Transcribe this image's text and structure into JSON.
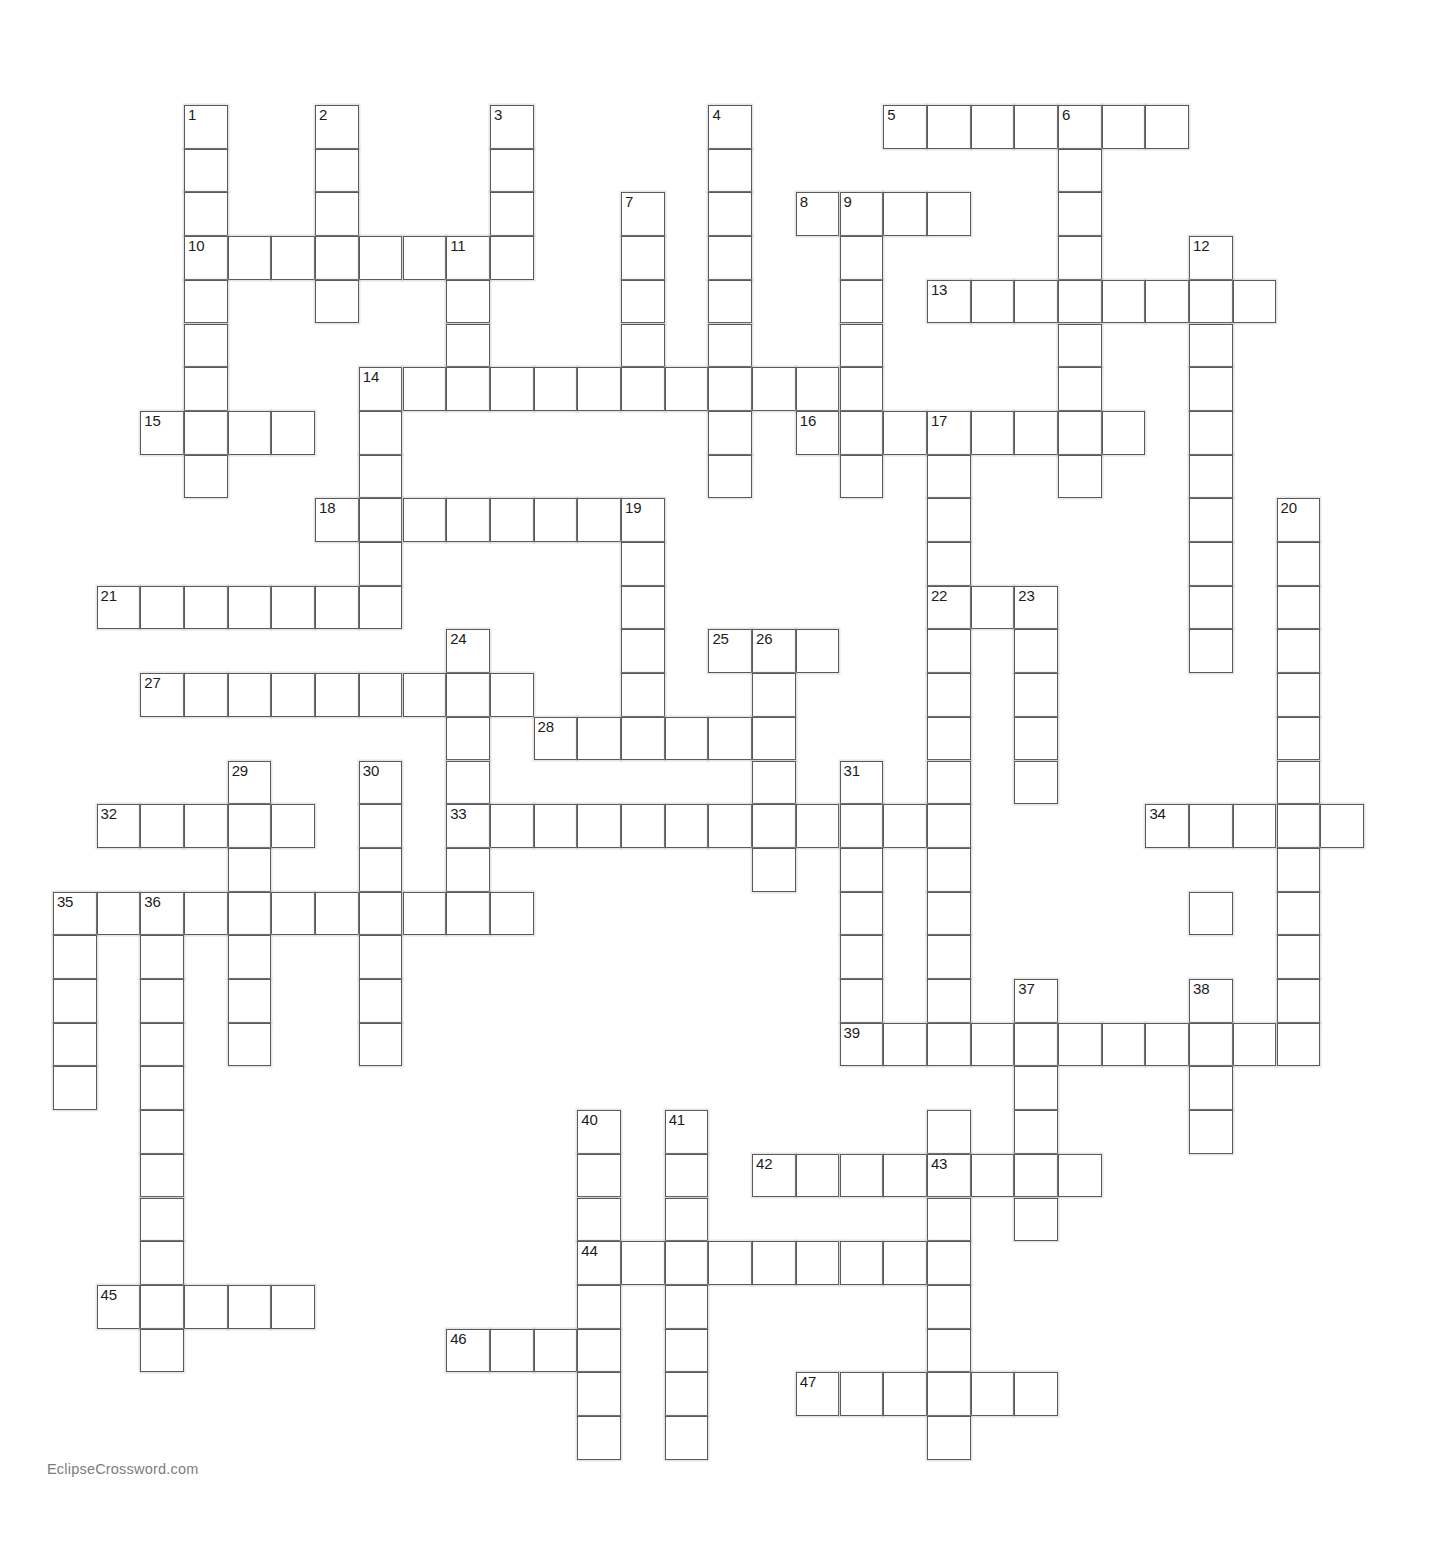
{
  "page": {
    "watermark": "EclipseCrossword.com",
    "background_color": "#ffffff",
    "cell_border_color": "#5a5a5a",
    "cell_fill_color": "#ffffff",
    "number_color": "#1c1c1c",
    "watermark_color": "#7d7d81"
  },
  "grid": {
    "cell_size": 43.7,
    "origin_x": 184,
    "origin_y": 105,
    "columns": 29,
    "rows": 32,
    "cells": [
      {
        "c": 0,
        "r": 0,
        "n": "1"
      },
      {
        "c": 0,
        "r": 1
      },
      {
        "c": 0,
        "r": 2
      },
      {
        "c": 3,
        "r": 0,
        "n": "2"
      },
      {
        "c": 3,
        "r": 1
      },
      {
        "c": 3,
        "r": 2
      },
      {
        "c": 7,
        "r": 0,
        "n": "3"
      },
      {
        "c": 7,
        "r": 1
      },
      {
        "c": 7,
        "r": 2
      },
      {
        "c": 12,
        "r": 0,
        "n": "4"
      },
      {
        "c": 12,
        "r": 1
      },
      {
        "c": 12,
        "r": 2
      },
      {
        "c": 16,
        "r": 0,
        "n": "5"
      },
      {
        "c": 17,
        "r": 0
      },
      {
        "c": 18,
        "r": 0
      },
      {
        "c": 19,
        "r": 0
      },
      {
        "c": 20,
        "r": 0,
        "n": "6"
      },
      {
        "c": 21,
        "r": 0
      },
      {
        "c": 22,
        "r": 0
      },
      {
        "c": 10,
        "r": 2,
        "n": "7"
      },
      {
        "c": 14,
        "r": 2,
        "n": "8"
      },
      {
        "c": 15,
        "r": 2,
        "n": "9"
      },
      {
        "c": 16,
        "r": 2
      },
      {
        "c": 17,
        "r": 2
      },
      {
        "c": 20,
        "r": 1
      },
      {
        "c": 20,
        "r": 2
      },
      {
        "c": 0,
        "r": 3,
        "n": "10"
      },
      {
        "c": 1,
        "r": 3
      },
      {
        "c": 2,
        "r": 3
      },
      {
        "c": 3,
        "r": 3
      },
      {
        "c": 4,
        "r": 3
      },
      {
        "c": 5,
        "r": 3
      },
      {
        "c": 6,
        "r": 3,
        "n": "11"
      },
      {
        "c": 7,
        "r": 3
      },
      {
        "c": 10,
        "r": 3
      },
      {
        "c": 12,
        "r": 3
      },
      {
        "c": 15,
        "r": 3
      },
      {
        "c": 20,
        "r": 3
      },
      {
        "c": 23,
        "r": 3,
        "n": "12"
      },
      {
        "c": 0,
        "r": 4
      },
      {
        "c": 3,
        "r": 4
      },
      {
        "c": 6,
        "r": 4
      },
      {
        "c": 10,
        "r": 4
      },
      {
        "c": 12,
        "r": 4
      },
      {
        "c": 15,
        "r": 4
      },
      {
        "c": 17,
        "r": 4,
        "n": "13"
      },
      {
        "c": 18,
        "r": 4
      },
      {
        "c": 19,
        "r": 4
      },
      {
        "c": 20,
        "r": 4
      },
      {
        "c": 21,
        "r": 4
      },
      {
        "c": 22,
        "r": 4
      },
      {
        "c": 23,
        "r": 4
      },
      {
        "c": 24,
        "r": 4
      },
      {
        "c": 0,
        "r": 5
      },
      {
        "c": 6,
        "r": 5
      },
      {
        "c": 10,
        "r": 5
      },
      {
        "c": 12,
        "r": 5
      },
      {
        "c": 15,
        "r": 5
      },
      {
        "c": 20,
        "r": 5
      },
      {
        "c": 23,
        "r": 5
      },
      {
        "c": 0,
        "r": 6
      },
      {
        "c": 4,
        "r": 6,
        "n": "14"
      },
      {
        "c": 5,
        "r": 6
      },
      {
        "c": 6,
        "r": 6
      },
      {
        "c": 7,
        "r": 6
      },
      {
        "c": 8,
        "r": 6
      },
      {
        "c": 9,
        "r": 6
      },
      {
        "c": 10,
        "r": 6
      },
      {
        "c": 11,
        "r": 6
      },
      {
        "c": 12,
        "r": 6
      },
      {
        "c": 13,
        "r": 6
      },
      {
        "c": 14,
        "r": 6
      },
      {
        "c": 15,
        "r": 6
      },
      {
        "c": 20,
        "r": 6
      },
      {
        "c": 23,
        "r": 6
      },
      {
        "c": -1,
        "r": 7,
        "n": "15"
      },
      {
        "c": 0,
        "r": 7
      },
      {
        "c": 1,
        "r": 7
      },
      {
        "c": 2,
        "r": 7
      },
      {
        "c": 4,
        "r": 7
      },
      {
        "c": 12,
        "r": 7
      },
      {
        "c": 14,
        "r": 7,
        "n": "16"
      },
      {
        "c": 15,
        "r": 7
      },
      {
        "c": 16,
        "r": 7
      },
      {
        "c": 17,
        "r": 7,
        "n": "17"
      },
      {
        "c": 18,
        "r": 7
      },
      {
        "c": 19,
        "r": 7
      },
      {
        "c": 20,
        "r": 7
      },
      {
        "c": 21,
        "r": 7
      },
      {
        "c": 23,
        "r": 7
      },
      {
        "c": 0,
        "r": 8
      },
      {
        "c": 4,
        "r": 8
      },
      {
        "c": 12,
        "r": 8
      },
      {
        "c": 15,
        "r": 8
      },
      {
        "c": 17,
        "r": 8
      },
      {
        "c": 20,
        "r": 8
      },
      {
        "c": 23,
        "r": 8
      },
      {
        "c": 3,
        "r": 9,
        "n": "18"
      },
      {
        "c": 4,
        "r": 9
      },
      {
        "c": 5,
        "r": 9
      },
      {
        "c": 6,
        "r": 9
      },
      {
        "c": 7,
        "r": 9
      },
      {
        "c": 8,
        "r": 9
      },
      {
        "c": 9,
        "r": 9
      },
      {
        "c": 10,
        "r": 9,
        "n": "19"
      },
      {
        "c": 17,
        "r": 9
      },
      {
        "c": 23,
        "r": 9
      },
      {
        "c": 25,
        "r": 9,
        "n": "20"
      },
      {
        "c": 4,
        "r": 10
      },
      {
        "c": 10,
        "r": 10
      },
      {
        "c": 17,
        "r": 10
      },
      {
        "c": 23,
        "r": 10
      },
      {
        "c": 25,
        "r": 10
      },
      {
        "c": -2,
        "r": 11,
        "n": "21"
      },
      {
        "c": -1,
        "r": 11
      },
      {
        "c": 0,
        "r": 11
      },
      {
        "c": 1,
        "r": 11
      },
      {
        "c": 2,
        "r": 11
      },
      {
        "c": 3,
        "r": 11
      },
      {
        "c": 4,
        "r": 11
      },
      {
        "c": 10,
        "r": 11
      },
      {
        "c": 17,
        "r": 11,
        "n": "22"
      },
      {
        "c": 18,
        "r": 11
      },
      {
        "c": 19,
        "r": 11,
        "n": "23"
      },
      {
        "c": 23,
        "r": 11
      },
      {
        "c": 25,
        "r": 11
      },
      {
        "c": 6,
        "r": 12,
        "n": "24"
      },
      {
        "c": 10,
        "r": 12
      },
      {
        "c": 12,
        "r": 12,
        "n": "25"
      },
      {
        "c": 13,
        "r": 12,
        "n": "26"
      },
      {
        "c": 14,
        "r": 12
      },
      {
        "c": 17,
        "r": 12
      },
      {
        "c": 19,
        "r": 12
      },
      {
        "c": 23,
        "r": 12
      },
      {
        "c": 25,
        "r": 12
      },
      {
        "c": -1,
        "r": 13,
        "n": "27"
      },
      {
        "c": 0,
        "r": 13
      },
      {
        "c": 1,
        "r": 13
      },
      {
        "c": 2,
        "r": 13
      },
      {
        "c": 3,
        "r": 13
      },
      {
        "c": 4,
        "r": 13
      },
      {
        "c": 5,
        "r": 13
      },
      {
        "c": 6,
        "r": 13
      },
      {
        "c": 7,
        "r": 13
      },
      {
        "c": 10,
        "r": 13
      },
      {
        "c": 13,
        "r": 13
      },
      {
        "c": 17,
        "r": 13
      },
      {
        "c": 19,
        "r": 13
      },
      {
        "c": 25,
        "r": 13
      },
      {
        "c": 6,
        "r": 14
      },
      {
        "c": 8,
        "r": 14,
        "n": "28"
      },
      {
        "c": 9,
        "r": 14
      },
      {
        "c": 10,
        "r": 14
      },
      {
        "c": 11,
        "r": 14
      },
      {
        "c": 12,
        "r": 14
      },
      {
        "c": 13,
        "r": 14
      },
      {
        "c": 17,
        "r": 14
      },
      {
        "c": 19,
        "r": 14
      },
      {
        "c": 25,
        "r": 14
      },
      {
        "c": 6,
        "r": 15
      },
      {
        "c": 13,
        "r": 15
      },
      {
        "c": 15,
        "r": 15,
        "n": "31"
      },
      {
        "c": 17,
        "r": 15
      },
      {
        "c": 19,
        "r": 15
      },
      {
        "c": 25,
        "r": 15
      },
      {
        "c": 1,
        "r": 15,
        "n": "29"
      },
      {
        "c": 4,
        "r": 15,
        "n": "30"
      },
      {
        "c": -2,
        "r": 16,
        "n": "32"
      },
      {
        "c": -1,
        "r": 16
      },
      {
        "c": 0,
        "r": 16
      },
      {
        "c": 1,
        "r": 16
      },
      {
        "c": 2,
        "r": 16
      },
      {
        "c": 4,
        "r": 16
      },
      {
        "c": 6,
        "r": 16,
        "n": "33"
      },
      {
        "c": 7,
        "r": 16
      },
      {
        "c": 8,
        "r": 16
      },
      {
        "c": 9,
        "r": 16
      },
      {
        "c": 10,
        "r": 16
      },
      {
        "c": 11,
        "r": 16
      },
      {
        "c": 12,
        "r": 16
      },
      {
        "c": 13,
        "r": 16
      },
      {
        "c": 14,
        "r": 16
      },
      {
        "c": 15,
        "r": 16
      },
      {
        "c": 16,
        "r": 16
      },
      {
        "c": 17,
        "r": 16
      },
      {
        "c": 22,
        "r": 16,
        "n": "34"
      },
      {
        "c": 23,
        "r": 16
      },
      {
        "c": 24,
        "r": 16
      },
      {
        "c": 25,
        "r": 16
      },
      {
        "c": 26,
        "r": 16
      },
      {
        "c": 1,
        "r": 17
      },
      {
        "c": 4,
        "r": 17
      },
      {
        "c": 6,
        "r": 17
      },
      {
        "c": 13,
        "r": 17
      },
      {
        "c": 15,
        "r": 17
      },
      {
        "c": 17,
        "r": 17
      },
      {
        "c": 25,
        "r": 17
      },
      {
        "c": -3,
        "r": 18,
        "n": "35"
      },
      {
        "c": -2,
        "r": 18
      },
      {
        "c": -1,
        "r": 18,
        "n": "36"
      },
      {
        "c": 0,
        "r": 18
      },
      {
        "c": 1,
        "r": 18
      },
      {
        "c": 2,
        "r": 18
      },
      {
        "c": 3,
        "r": 18
      },
      {
        "c": 4,
        "r": 18
      },
      {
        "c": 5,
        "r": 18
      },
      {
        "c": 6,
        "r": 18
      },
      {
        "c": 7,
        "r": 18
      },
      {
        "c": 15,
        "r": 18
      },
      {
        "c": 17,
        "r": 18
      },
      {
        "c": 23,
        "r": 18
      },
      {
        "c": 25,
        "r": 18
      },
      {
        "c": -3,
        "r": 19
      },
      {
        "c": -1,
        "r": 19
      },
      {
        "c": 1,
        "r": 19
      },
      {
        "c": 4,
        "r": 19
      },
      {
        "c": 15,
        "r": 19
      },
      {
        "c": 17,
        "r": 19
      },
      {
        "c": 25,
        "r": 19
      },
      {
        "c": -3,
        "r": 20
      },
      {
        "c": -1,
        "r": 20
      },
      {
        "c": 1,
        "r": 20
      },
      {
        "c": 4,
        "r": 20
      },
      {
        "c": 15,
        "r": 20
      },
      {
        "c": 19,
        "r": 20,
        "n": "37"
      },
      {
        "c": 17,
        "r": 20
      },
      {
        "c": 23,
        "r": 20,
        "n": "38"
      },
      {
        "c": 25,
        "r": 20
      },
      {
        "c": -3,
        "r": 21
      },
      {
        "c": -1,
        "r": 21
      },
      {
        "c": 1,
        "r": 21
      },
      {
        "c": 4,
        "r": 21
      },
      {
        "c": 15,
        "r": 21,
        "n": "39"
      },
      {
        "c": 16,
        "r": 21
      },
      {
        "c": 17,
        "r": 21
      },
      {
        "c": 18,
        "r": 21
      },
      {
        "c": 19,
        "r": 21
      },
      {
        "c": 20,
        "r": 21
      },
      {
        "c": 21,
        "r": 21
      },
      {
        "c": 22,
        "r": 21
      },
      {
        "c": 23,
        "r": 21
      },
      {
        "c": 24,
        "r": 21
      },
      {
        "c": 25,
        "r": 21
      },
      {
        "c": -3,
        "r": 22
      },
      {
        "c": -1,
        "r": 22
      },
      {
        "c": 19,
        "r": 22
      },
      {
        "c": 23,
        "r": 22
      },
      {
        "c": -1,
        "r": 23
      },
      {
        "c": 9,
        "r": 23,
        "n": "40"
      },
      {
        "c": 11,
        "r": 23,
        "n": "41"
      },
      {
        "c": 17,
        "r": 23
      },
      {
        "c": 19,
        "r": 23
      },
      {
        "c": 23,
        "r": 23
      },
      {
        "c": -1,
        "r": 24
      },
      {
        "c": 9,
        "r": 24
      },
      {
        "c": 11,
        "r": 24
      },
      {
        "c": 13,
        "r": 24,
        "n": "42"
      },
      {
        "c": 14,
        "r": 24
      },
      {
        "c": 15,
        "r": 24
      },
      {
        "c": 16,
        "r": 24
      },
      {
        "c": 17,
        "r": 24,
        "n": "43"
      },
      {
        "c": 18,
        "r": 24
      },
      {
        "c": 19,
        "r": 24
      },
      {
        "c": 20,
        "r": 24
      },
      {
        "c": -1,
        "r": 25
      },
      {
        "c": 9,
        "r": 25
      },
      {
        "c": 11,
        "r": 25
      },
      {
        "c": 17,
        "r": 25
      },
      {
        "c": 19,
        "r": 25
      },
      {
        "c": -1,
        "r": 26
      },
      {
        "c": 9,
        "r": 26,
        "n": "44"
      },
      {
        "c": 10,
        "r": 26
      },
      {
        "c": 11,
        "r": 26
      },
      {
        "c": 12,
        "r": 26
      },
      {
        "c": 13,
        "r": 26
      },
      {
        "c": 14,
        "r": 26
      },
      {
        "c": 15,
        "r": 26
      },
      {
        "c": 16,
        "r": 26
      },
      {
        "c": 17,
        "r": 26
      },
      {
        "c": -2,
        "r": 27,
        "n": "45"
      },
      {
        "c": -1,
        "r": 27
      },
      {
        "c": 0,
        "r": 27
      },
      {
        "c": 1,
        "r": 27
      },
      {
        "c": 2,
        "r": 27
      },
      {
        "c": 9,
        "r": 27
      },
      {
        "c": 11,
        "r": 27
      },
      {
        "c": 17,
        "r": 27
      },
      {
        "c": -1,
        "r": 28
      },
      {
        "c": 6,
        "r": 28,
        "n": "46"
      },
      {
        "c": 7,
        "r": 28
      },
      {
        "c": 8,
        "r": 28
      },
      {
        "c": 9,
        "r": 28
      },
      {
        "c": 11,
        "r": 28
      },
      {
        "c": 17,
        "r": 28
      },
      {
        "c": 9,
        "r": 29
      },
      {
        "c": 11,
        "r": 29
      },
      {
        "c": 14,
        "r": 29,
        "n": "47"
      },
      {
        "c": 15,
        "r": 29
      },
      {
        "c": 16,
        "r": 29
      },
      {
        "c": 17,
        "r": 29
      },
      {
        "c": 18,
        "r": 29
      },
      {
        "c": 19,
        "r": 29
      },
      {
        "c": 9,
        "r": 30
      },
      {
        "c": 11,
        "r": 30
      },
      {
        "c": 17,
        "r": 30
      }
    ],
    "clue_numbers": [
      "1",
      "2",
      "3",
      "4",
      "5",
      "6",
      "7",
      "8",
      "9",
      "10",
      "11",
      "12",
      "13",
      "14",
      "15",
      "16",
      "17",
      "18",
      "19",
      "20",
      "21",
      "22",
      "23",
      "24",
      "25",
      "26",
      "27",
      "28",
      "29",
      "30",
      "31",
      "32",
      "33",
      "34",
      "35",
      "36",
      "37",
      "38",
      "39",
      "40",
      "41",
      "42",
      "43",
      "44",
      "45",
      "46",
      "47"
    ]
  }
}
